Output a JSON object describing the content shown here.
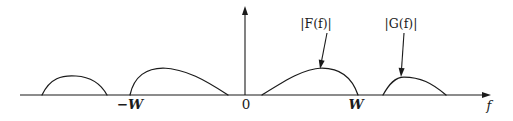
{
  "figure": {
    "background_color": "#ffffff",
    "ink_color": "#1b1b1b"
  },
  "axes": {
    "x_axis_name": "f",
    "x_axis_name_full": "f",
    "y_axis_name": "",
    "tick_labels": [
      {
        "id": "minus-w",
        "text": "−W",
        "x": 130,
        "y": 104
      },
      {
        "id": "zero",
        "text": "0",
        "x": 246,
        "y": 104
      },
      {
        "id": "w",
        "text": "W",
        "x": 356,
        "y": 104
      }
    ],
    "baseline_y": 95,
    "origin_x": 245,
    "x_axis_start": 20,
    "x_axis_end": 491,
    "y_axis_top": 6
  },
  "callouts": [
    {
      "id": "f-label",
      "text": "|F(f)|",
      "prefix": "|",
      "func": "F",
      "open": "(",
      "arg": "f",
      "close": ")",
      "suffix": "|",
      "label_x": 316,
      "label_y": 24,
      "arrow_from_x": 327,
      "arrow_from_y": 33,
      "arrow_to_x": 320,
      "arrow_to_y": 69
    },
    {
      "id": "g-label",
      "text": "|G(f)|",
      "prefix": "|",
      "func": "G",
      "open": "(",
      "arg": "f",
      "close": ")",
      "suffix": "|",
      "label_x": 401,
      "label_y": 24,
      "arrow_from_x": 404,
      "arrow_from_y": 33,
      "arrow_to_x": 401,
      "arrow_to_y": 77
    }
  ],
  "chart_data": {
    "type": "line",
    "title": "",
    "xlabel": "f",
    "ylabel": "",
    "grid": false,
    "legend": "annotations",
    "xlim": [
      20,
      491
    ],
    "ylim": [
      95,
      60
    ],
    "annotations": [
      "|F(f)|",
      "|G(f)|"
    ],
    "tick_values": [
      "−W",
      "0",
      "W"
    ],
    "series": [
      {
        "name": "G(-f) image lobe (leftmost)",
        "role": "mirrored-G",
        "start_x": 42,
        "end_x": 107,
        "peak_x": 76,
        "peak_y": 76,
        "baseline_y": 95,
        "path": "M 42 95 C 50 78, 62 75, 76 76 C 92 77, 101 84, 107 95"
      },
      {
        "name": "F(-f) image lobe",
        "role": "mirrored-F",
        "start_x": 130,
        "end_x": 228,
        "peak_x": 163,
        "peak_y": 68,
        "baseline_y": 95,
        "path": "M 130 95 C 134 76, 147 68, 163 68 C 186 69, 205 80, 228 95"
      },
      {
        "name": "|F(f)|",
        "role": "F",
        "start_x": 262,
        "end_x": 358,
        "peak_x": 322,
        "peak_y": 68,
        "baseline_y": 95,
        "path": "M 262 95 C 286 80, 303 69, 322 68 C 340 68, 352 77, 358 95"
      },
      {
        "name": "|G(f)|",
        "role": "G",
        "start_x": 383,
        "end_x": 446,
        "peak_x": 404,
        "peak_y": 77,
        "baseline_y": 95,
        "path": "M 383 95 C 389 84, 395 77, 404 77, C 420 77, 432 83, 446 95"
      }
    ]
  }
}
